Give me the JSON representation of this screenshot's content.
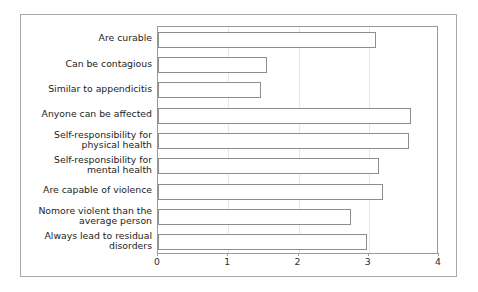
{
  "chart_data": {
    "type": "bar",
    "orientation": "horizontal",
    "title": "",
    "subtitle": "",
    "xlabel": "",
    "ylabel": "",
    "xlim": [
      0,
      4
    ],
    "ylim": null,
    "grid": true,
    "grid_axis": "x",
    "legend": null,
    "legend_position": "none",
    "xticks": [
      "0",
      "1",
      "2",
      "3",
      "4"
    ],
    "xtick_values": [
      0,
      1,
      2,
      3,
      4
    ],
    "categories": [
      "Are curable",
      "Can be contagious",
      "Similar to appendicitis",
      "Anyone can be affected",
      "Self-responsibility for physical health",
      "Self-responsibility for mental health",
      "Are capable of violence",
      "Nomore violent than the average person",
      "Always lead to residual disorders"
    ],
    "category_lines": [
      [
        "Are curable"
      ],
      [
        "Can be contagious"
      ],
      [
        "Similar to appendicitis"
      ],
      [
        "Anyone can be affected"
      ],
      [
        "Self-responsibility for",
        "physical health"
      ],
      [
        "Self-responsibility for",
        "mental health"
      ],
      [
        "Are capable of violence"
      ],
      [
        "Nomore violent than the",
        "average person"
      ],
      [
        "Always lead to residual",
        "disorders"
      ]
    ],
    "values": [
      3.1,
      1.55,
      1.47,
      3.6,
      3.58,
      3.15,
      3.2,
      2.75,
      2.98
    ],
    "series": [
      {
        "name": "",
        "values": [
          3.1,
          1.55,
          1.47,
          3.6,
          3.58,
          3.15,
          3.2,
          2.75,
          2.98
        ]
      }
    ],
    "colors": {
      "bar_fill": "#ffffff",
      "bar_edge": "#8d8d8d",
      "axis": "#9a9a9a",
      "grid": "#e6e6e6",
      "text": "#1c1c1c",
      "frame": "#a8a8a8",
      "background": "#ffffff"
    }
  }
}
